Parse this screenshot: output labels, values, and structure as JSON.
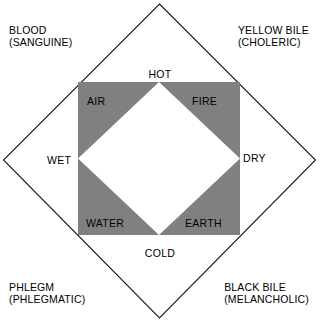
{
  "figure": {
    "colors": {
      "square_fill": "#808080",
      "diamond_fill": "#ffffff",
      "outline": "#000000",
      "background": "#ffffff"
    }
  },
  "humours": [
    {
      "id": "blood",
      "name": "BLOOD",
      "temperament": "(SANGUINE)",
      "corner": "top-left"
    },
    {
      "id": "yellow-bile",
      "name": "YELLOW BILE",
      "temperament": "(CHOLERIC)",
      "corner": "top-right"
    },
    {
      "id": "phlegm",
      "name": "PHLEGM",
      "temperament": "(PHLEGMATIC)",
      "corner": "bottom-left"
    },
    {
      "id": "black-bile",
      "name": "BLACK BILE",
      "temperament": "(MELANCHOLIC)",
      "corner": "bottom-right"
    }
  ],
  "qualities": [
    {
      "id": "hot",
      "label": "HOT",
      "position": "top"
    },
    {
      "id": "dry",
      "label": "DRY",
      "position": "right"
    },
    {
      "id": "cold",
      "label": "COLD",
      "position": "bottom"
    },
    {
      "id": "wet",
      "label": "WET",
      "position": "left"
    }
  ],
  "elements": [
    {
      "id": "air",
      "label": "AIR",
      "position": "top-left"
    },
    {
      "id": "fire",
      "label": "FIRE",
      "position": "top-right"
    },
    {
      "id": "water",
      "label": "WATER",
      "position": "bottom-left"
    },
    {
      "id": "earth",
      "label": "EARTH",
      "position": "bottom-right"
    }
  ]
}
